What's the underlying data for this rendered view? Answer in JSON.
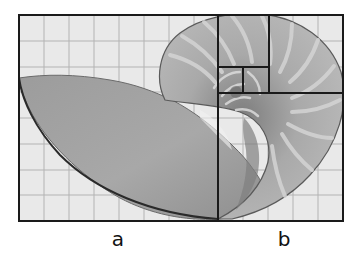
{
  "figure": {
    "frame": {
      "x": 19,
      "y": 15,
      "width": 324,
      "height": 206
    },
    "grid": {
      "columns": 13,
      "rows": 8
    },
    "colors": {
      "background": "#e9e9e9",
      "grid_line": "#b3b3b3",
      "frame_line": "#1a1a1a",
      "shell_body": "#a3a3a3",
      "shell_dark": "#8c8c8c",
      "shell_rib": "#d2d2d2",
      "shell_outline": "#555555"
    },
    "golden_division_lines": [
      {
        "x1": 218,
        "y1": 15,
        "x2": 218,
        "y2": 221
      },
      {
        "x1": 269,
        "y1": 15,
        "x2": 269,
        "y2": 93
      },
      {
        "x1": 218,
        "y1": 93,
        "x2": 343,
        "y2": 93
      },
      {
        "x1": 218,
        "y1": 67,
        "x2": 269,
        "y2": 67
      },
      {
        "x1": 243,
        "y1": 67,
        "x2": 243,
        "y2": 93
      }
    ]
  },
  "labels": {
    "a": "a",
    "b": "b"
  }
}
